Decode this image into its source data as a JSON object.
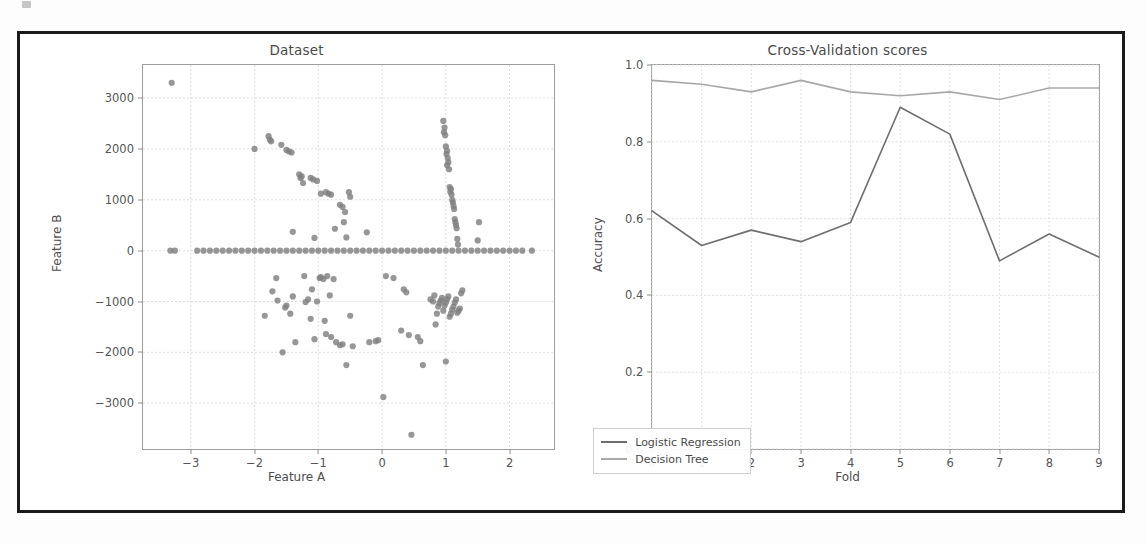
{
  "figure": {
    "background": "#ffffff",
    "frame_color": "#1a1a1a",
    "artifact_name": "scan-artifact"
  },
  "charts": [
    {
      "id": "dataset-scatter",
      "title": "Dataset",
      "xlabel": "Feature A",
      "ylabel": "Feature B",
      "xticks": [
        "-3",
        "-2",
        "-1",
        "0",
        "1",
        "2"
      ],
      "yticks": [
        "3000",
        "2000",
        "1000",
        "0",
        "-1000",
        "-2000",
        "-3000"
      ],
      "marker_color": "#808080"
    },
    {
      "id": "cv-scores-line",
      "title": "Cross-Validation scores",
      "xlabel": "Fold",
      "ylabel": "Accuracy",
      "xticks": [
        "0",
        "1",
        "2",
        "3",
        "4",
        "5",
        "6",
        "7",
        "8",
        "9"
      ],
      "yticks": [
        "1.0",
        "0.8",
        "0.6",
        "0.4",
        "0.2",
        "0.0"
      ],
      "legend": [
        {
          "label": "Logistic Regression",
          "color": "#6e6e6e"
        },
        {
          "label": "Decision Tree",
          "color": "#a8a8a8"
        }
      ]
    }
  ],
  "chart_data": [
    {
      "type": "scatter",
      "title": "Dataset",
      "xlabel": "Feature A",
      "ylabel": "Feature B",
      "xlim": [
        -3.75,
        2.7
      ],
      "ylim": [
        -3900,
        3650
      ],
      "grid": true,
      "marker_color": "#808080",
      "xticks": [
        -3,
        -2,
        -1,
        0,
        1,
        2
      ],
      "yticks": [
        3000,
        2000,
        1000,
        0,
        -1000,
        -2000,
        -3000
      ],
      "series": [
        {
          "name": "samples",
          "points": [
            [
              -3.3,
              3300
            ],
            [
              -2.0,
              2000
            ],
            [
              -1.78,
              2250
            ],
            [
              -1.76,
              2180
            ],
            [
              -1.74,
              2150
            ],
            [
              -1.58,
              2080
            ],
            [
              -1.5,
              1980
            ],
            [
              -1.46,
              1950
            ],
            [
              -1.42,
              1930
            ],
            [
              -1.3,
              1500
            ],
            [
              -1.28,
              1430
            ],
            [
              -1.26,
              1460
            ],
            [
              -1.24,
              1330
            ],
            [
              -1.12,
              1430
            ],
            [
              -1.08,
              1400
            ],
            [
              -1.02,
              1370
            ],
            [
              -0.96,
              1120
            ],
            [
              -0.88,
              1150
            ],
            [
              -0.84,
              1120
            ],
            [
              -0.8,
              1100
            ],
            [
              -0.52,
              1150
            ],
            [
              -0.5,
              1060
            ],
            [
              -0.66,
              900
            ],
            [
              -0.62,
              860
            ],
            [
              -0.58,
              760
            ],
            [
              -0.6,
              560
            ],
            [
              -1.4,
              370
            ],
            [
              -1.06,
              250
            ],
            [
              -0.74,
              430
            ],
            [
              -0.56,
              260
            ],
            [
              -0.24,
              360
            ],
            [
              0.96,
              2550
            ],
            [
              0.98,
              2420
            ],
            [
              0.97,
              2330
            ],
            [
              0.99,
              2270
            ],
            [
              1.0,
              2050
            ],
            [
              1.02,
              1960
            ],
            [
              1.01,
              1900
            ],
            [
              1.03,
              1820
            ],
            [
              1.04,
              1740
            ],
            [
              1.02,
              1680
            ],
            [
              1.05,
              1600
            ],
            [
              1.06,
              1250
            ],
            [
              1.08,
              1210
            ],
            [
              1.07,
              1160
            ],
            [
              1.09,
              1100
            ],
            [
              1.1,
              1000
            ],
            [
              1.11,
              950
            ],
            [
              1.12,
              880
            ],
            [
              1.13,
              820
            ],
            [
              1.14,
              620
            ],
            [
              1.15,
              560
            ],
            [
              1.16,
              500
            ],
            [
              1.17,
              440
            ],
            [
              1.18,
              230
            ],
            [
              1.19,
              120
            ],
            [
              1.52,
              560
            ],
            [
              1.5,
              200
            ],
            [
              -3.32,
              0
            ],
            [
              -3.25,
              0
            ],
            [
              -2.9,
              0
            ],
            [
              -2.8,
              0
            ],
            [
              -2.7,
              0
            ],
            [
              -2.6,
              0
            ],
            [
              -2.5,
              0
            ],
            [
              -2.4,
              0
            ],
            [
              -2.3,
              0
            ],
            [
              -2.2,
              0
            ],
            [
              -2.1,
              0
            ],
            [
              -2.0,
              0
            ],
            [
              -1.9,
              0
            ],
            [
              -1.8,
              0
            ],
            [
              -1.7,
              0
            ],
            [
              -1.6,
              0
            ],
            [
              -1.5,
              0
            ],
            [
              -1.4,
              0
            ],
            [
              -1.3,
              0
            ],
            [
              -1.2,
              0
            ],
            [
              -1.1,
              0
            ],
            [
              -1.0,
              0
            ],
            [
              -0.9,
              0
            ],
            [
              -0.8,
              0
            ],
            [
              -0.7,
              0
            ],
            [
              -0.6,
              0
            ],
            [
              -0.5,
              0
            ],
            [
              -0.4,
              0
            ],
            [
              -0.3,
              0
            ],
            [
              -0.2,
              0
            ],
            [
              -0.1,
              0
            ],
            [
              0.0,
              0
            ],
            [
              0.1,
              0
            ],
            [
              0.2,
              0
            ],
            [
              0.3,
              0
            ],
            [
              0.4,
              0
            ],
            [
              0.5,
              0
            ],
            [
              0.6,
              0
            ],
            [
              0.7,
              0
            ],
            [
              0.8,
              0
            ],
            [
              0.9,
              0
            ],
            [
              1.0,
              0
            ],
            [
              1.1,
              0
            ],
            [
              1.2,
              0
            ],
            [
              1.3,
              0
            ],
            [
              1.4,
              0
            ],
            [
              1.5,
              0
            ],
            [
              1.6,
              0
            ],
            [
              1.7,
              0
            ],
            [
              1.8,
              0
            ],
            [
              1.9,
              0
            ],
            [
              2.0,
              0
            ],
            [
              2.1,
              0
            ],
            [
              2.2,
              0
            ],
            [
              2.35,
              0
            ],
            [
              -1.84,
              -1280
            ],
            [
              -1.72,
              -800
            ],
            [
              -1.66,
              -540
            ],
            [
              -1.64,
              -980
            ],
            [
              -1.56,
              -2000
            ],
            [
              -1.52,
              -1120
            ],
            [
              -1.5,
              -1080
            ],
            [
              -1.44,
              -1240
            ],
            [
              -1.4,
              -900
            ],
            [
              -1.36,
              -1800
            ],
            [
              -1.22,
              -500
            ],
            [
              -1.2,
              -1010
            ],
            [
              -1.16,
              -960
            ],
            [
              -1.12,
              -1340
            ],
            [
              -1.1,
              -760
            ],
            [
              -1.06,
              -1740
            ],
            [
              -1.02,
              -1000
            ],
            [
              -0.98,
              -540
            ],
            [
              -0.96,
              -520
            ],
            [
              -0.92,
              -560
            ],
            [
              -0.9,
              -1380
            ],
            [
              -0.88,
              -1640
            ],
            [
              -0.86,
              -500
            ],
            [
              -0.82,
              -880
            ],
            [
              -0.8,
              -1700
            ],
            [
              -0.76,
              -560
            ],
            [
              -0.72,
              -1800
            ],
            [
              -0.66,
              -1860
            ],
            [
              -0.62,
              -1840
            ],
            [
              -0.56,
              -2250
            ],
            [
              -0.5,
              -1280
            ],
            [
              -0.46,
              -1880
            ],
            [
              -0.2,
              -1800
            ],
            [
              -0.1,
              -1780
            ],
            [
              -0.06,
              -1760
            ],
            [
              0.02,
              -2880
            ],
            [
              0.06,
              -500
            ],
            [
              0.18,
              -540
            ],
            [
              0.3,
              -1570
            ],
            [
              0.34,
              -760
            ],
            [
              0.38,
              -820
            ],
            [
              0.42,
              -1660
            ],
            [
              0.46,
              -3620
            ],
            [
              0.56,
              -1700
            ],
            [
              0.6,
              -1780
            ],
            [
              0.64,
              -2250
            ],
            [
              0.76,
              -960
            ],
            [
              0.8,
              -1000
            ],
            [
              0.82,
              -880
            ],
            [
              0.84,
              -1450
            ],
            [
              0.86,
              -1240
            ],
            [
              0.88,
              -1100
            ],
            [
              0.9,
              -1030
            ],
            [
              0.92,
              -980
            ],
            [
              0.94,
              -930
            ],
            [
              0.96,
              -1180
            ],
            [
              0.98,
              -1080
            ],
            [
              1.0,
              -1020
            ],
            [
              1.02,
              -960
            ],
            [
              1.04,
              -900
            ],
            [
              1.06,
              -1300
            ],
            [
              1.08,
              -1240
            ],
            [
              1.1,
              -1160
            ],
            [
              1.12,
              -1100
            ],
            [
              1.14,
              -1020
            ],
            [
              1.16,
              -960
            ],
            [
              1.18,
              -1220
            ],
            [
              1.2,
              -1180
            ],
            [
              1.22,
              -1140
            ],
            [
              1.24,
              -840
            ],
            [
              1.26,
              -780
            ],
            [
              1.0,
              -2180
            ]
          ]
        }
      ]
    },
    {
      "type": "line",
      "title": "Cross-Validation scores",
      "xlabel": "Fold",
      "ylabel": "Accuracy",
      "xlim": [
        0,
        9
      ],
      "ylim": [
        0.0,
        1.0
      ],
      "grid": true,
      "legend_position": "lower left",
      "x": [
        0,
        1,
        2,
        3,
        4,
        5,
        6,
        7,
        8,
        9
      ],
      "series": [
        {
          "name": "Logistic Regression",
          "color": "#6e6e6e",
          "values": [
            0.62,
            0.53,
            0.57,
            0.54,
            0.59,
            0.89,
            0.82,
            0.49,
            0.56,
            0.5
          ]
        },
        {
          "name": "Decision Tree",
          "color": "#a8a8a8",
          "values": [
            0.96,
            0.95,
            0.93,
            0.96,
            0.93,
            0.92,
            0.93,
            0.91,
            0.94,
            0.94
          ]
        }
      ]
    }
  ]
}
